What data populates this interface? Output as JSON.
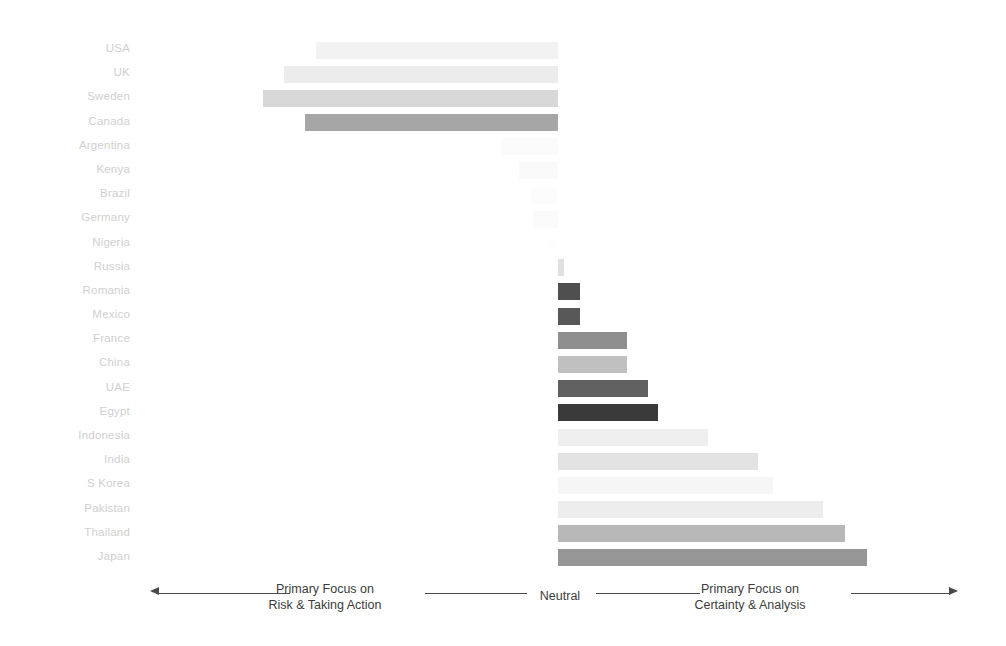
{
  "chart_data": {
    "type": "bar",
    "orientation": "horizontal",
    "title": "",
    "subtitle": "",
    "xlabel": "",
    "ylabel": "",
    "grid": false,
    "legend": null,
    "axis_center_label": "Neutral",
    "axis_left_label": "Primary Focus on Risk & Taking Action",
    "axis_right_label": "Primary Focus on Certainty & Analysis",
    "xlim": [
      -100,
      100
    ],
    "categories": [
      "USA",
      "UK",
      "Sweden",
      "Canada",
      "Argentina",
      "Kenya",
      "Brazil",
      "Germany",
      "Nigeria",
      "Russia",
      "Romania",
      "Mexico",
      "France",
      "China",
      "UAE",
      "Egypt",
      "Indonesia",
      "India",
      "S Korea",
      "Pakistan",
      "Thailand",
      "Japan"
    ],
    "values": [
      -68,
      -77,
      -83,
      -71,
      -16,
      -11,
      -8,
      -7,
      -3,
      2,
      7,
      7,
      22,
      22,
      29,
      32,
      48,
      64,
      69,
      85,
      92,
      99
    ],
    "bar_colors": [
      "#f2f2f2",
      "#ececec",
      "#d8d8d8",
      "#a6a6a6",
      "#fbfbfb",
      "#fafafa",
      "#fcfcfc",
      "#fbfbfb",
      "#fefefe",
      "#e0e0e0",
      "#4f4f4f",
      "#585858",
      "#8f8f8f",
      "#c0c0c0",
      "#606060",
      "#3a3a3a",
      "#efefef",
      "#e3e3e3",
      "#f6f6f6",
      "#ededed",
      "#b8b8b8",
      "#969696"
    ]
  },
  "axis": {
    "left_line_1": "Primary Focus on",
    "left_line_2": "Risk & Taking Action",
    "center": "Neutral",
    "right_line_1": "Primary Focus on",
    "right_line_2": "Certainty & Analysis"
  }
}
